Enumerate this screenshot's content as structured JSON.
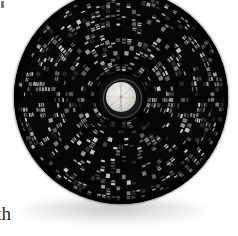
{
  "figure": {
    "alt_description": "Circular segmented detector disc viewed face-on, dense radial block pattern, bright metallic central hub, on white background",
    "background_color": "#ffffff",
    "disc_color": "#070707",
    "texture_color": "#9a9a9a",
    "hub_color": "#e3e1dd",
    "rim_color": "#555555"
  },
  "caption": {
    "fragment_text": "th"
  },
  "artifacts": {
    "speck_label": "page-speck"
  },
  "chart_data": {
    "type": "scatter",
    "title": "",
    "xlabel": "",
    "ylabel": "",
    "layout": "polar-radial-mosaic",
    "grid": false,
    "legend": false,
    "center": [
      107,
      97
    ],
    "outer_radius": 107,
    "hub_radius": 15,
    "hub_ring_radius": 18,
    "hub_outer_radius": 23,
    "ring_count": 15,
    "ring_radii": [
      26,
      31,
      36,
      41,
      47,
      53,
      59,
      65,
      71,
      77,
      83,
      89,
      94,
      99,
      104
    ],
    "sectors_per_ring": [
      28,
      32,
      38,
      44,
      50,
      58,
      64,
      72,
      80,
      88,
      96,
      104,
      112,
      120,
      128
    ],
    "brightness_levels": [
      0.0,
      0.18,
      0.34,
      0.5,
      0.66,
      0.82,
      1.0
    ],
    "fill_fraction": 0.54,
    "spoke_count": 8,
    "spoke_angles_deg": [
      0,
      45,
      90,
      135,
      180,
      225,
      270,
      315
    ]
  }
}
